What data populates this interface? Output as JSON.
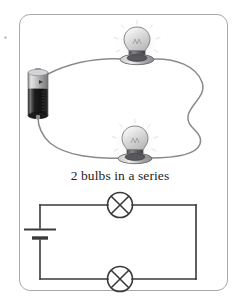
{
  "page": {
    "background_color": "#ffffff",
    "frame_border_color": "#a9a9ad"
  },
  "caption": {
    "text": "2 bulbs in a series"
  },
  "pictorial": {
    "title": "pictorial-circuit",
    "battery": {
      "label": "d-cell-battery",
      "cap_color": "#b9b9bb",
      "body_color": "#1d1d1d",
      "highlight_color": "#d9d9db"
    },
    "wire_color": "#8a8a8e",
    "bulbs": [
      {
        "label": "lit-bulb-top",
        "state": "lit",
        "glass_color": "#d2d2d4",
        "socket_color": "#6e6e72",
        "glow_color": "#f0f0ee"
      },
      {
        "label": "lit-bulb-bottom",
        "state": "lit",
        "glass_color": "#d2d2d4",
        "socket_color": "#6e6e72",
        "glow_color": "#f0f0ee"
      }
    ]
  },
  "schematic": {
    "title": "schematic-circuit",
    "wire_color": "#3a3a3a",
    "battery_symbol": {
      "label": "battery-cell-symbol",
      "positive_plate": "long-plate",
      "negative_plate": "short-plate"
    },
    "lamps": [
      {
        "label": "lamp-symbol-top",
        "symbol": "circle-with-cross"
      },
      {
        "label": "lamp-symbol-bottom",
        "symbol": "circle-with-cross"
      }
    ]
  }
}
